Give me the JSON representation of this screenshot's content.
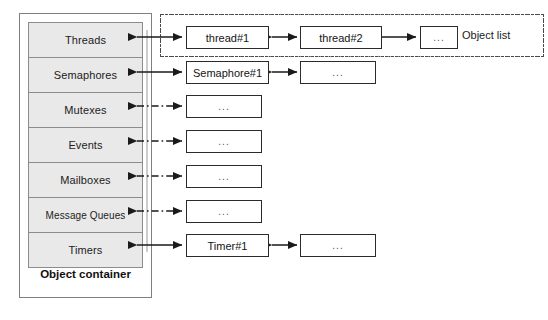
{
  "diagram": {
    "container": {
      "label": "Object container",
      "rows": [
        {
          "name": "Threads",
          "link": "solid"
        },
        {
          "name": "Semaphores",
          "link": "solid"
        },
        {
          "name": "Mutexes",
          "link": "dash-dot"
        },
        {
          "name": "Events",
          "link": "dash-dot"
        },
        {
          "name": "Mailboxes",
          "link": "dash-dot"
        },
        {
          "name": "Message Queues",
          "link": "dash-dot"
        },
        {
          "name": "Timers",
          "link": "solid"
        }
      ]
    },
    "object_list": {
      "label": "Object list",
      "border_style": "dash-dot",
      "rows": [
        {
          "nodes": [
            "thread#1",
            "thread#2",
            "..."
          ]
        },
        {
          "nodes": [
            "Semaphore#1",
            "..."
          ]
        },
        {
          "nodes": [
            "..."
          ]
        },
        {
          "nodes": [
            "..."
          ]
        },
        {
          "nodes": [
            "..."
          ]
        },
        {
          "nodes": [
            "..."
          ]
        },
        {
          "nodes": [
            "Timer#1",
            "..."
          ]
        }
      ]
    },
    "colors": {
      "cell_fill": "#e9e9e9",
      "cell_border": "#8c8c8c",
      "container_border": "#7f7f7f",
      "node_border": "#2b2b2b",
      "arrow": "#1a1a1a",
      "objlist_border": "#4a4a4a"
    }
  }
}
